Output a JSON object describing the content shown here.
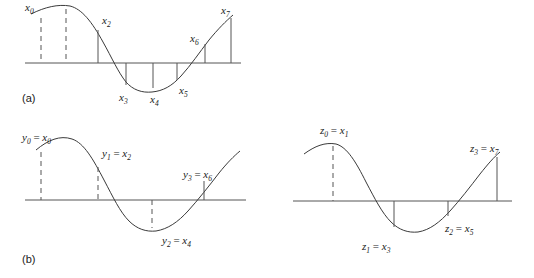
{
  "figure": {
    "title": "",
    "panels": [
      {
        "id": "a",
        "caption": "(a)",
        "signal": "continuous sinusoid-like waveform",
        "samples": [
          {
            "label": "x",
            "sub": "0",
            "text": "x0",
            "x": 41,
            "y": 18,
            "stem": "dashed",
            "side": "above"
          },
          {
            "label": "x",
            "sub": "1",
            "text": "x1",
            "x": 66,
            "y": 9,
            "stem": "dashed",
            "side": "above",
            "hidden": true
          },
          {
            "label": "x",
            "sub": "2",
            "text": "x2",
            "x": 98,
            "y": 26,
            "stem": "solid",
            "side": "above"
          },
          {
            "label": "x",
            "sub": "3",
            "text": "x3",
            "x": 126,
            "y": 88,
            "stem": "solid",
            "side": "below"
          },
          {
            "label": "x",
            "sub": "4",
            "text": "x4",
            "x": 153,
            "y": 91,
            "stem": "solid",
            "side": "below"
          },
          {
            "label": "x",
            "sub": "5",
            "text": "x5",
            "x": 177,
            "y": 80,
            "stem": "solid",
            "side": "below"
          },
          {
            "label": "x",
            "sub": "6",
            "text": "x6",
            "x": 205,
            "y": 45,
            "stem": "solid",
            "side": "above"
          },
          {
            "label": "x",
            "sub": "7",
            "text": "x7",
            "x": 231,
            "y": 18,
            "stem": "solid",
            "side": "above"
          }
        ]
      },
      {
        "id": "b-left",
        "caption": "(b)",
        "signal": "continuous sinusoid-like waveform, even-indexed samples",
        "samples": [
          {
            "text": "y0 = x0",
            "var": "y",
            "sub": "0",
            "eq": "=",
            "src": "x",
            "srcsub": "0",
            "x": 41,
            "stem": "dashed",
            "side": "above"
          },
          {
            "text": "y1 = x2",
            "var": "y",
            "sub": "1",
            "eq": "=",
            "src": "x",
            "srcsub": "2",
            "x": 98,
            "stem": "dashed",
            "side": "above"
          },
          {
            "text": "y2 = x4",
            "var": "y",
            "sub": "2",
            "eq": "=",
            "src": "x",
            "srcsub": "4",
            "x": 152,
            "stem": "dashed",
            "side": "below"
          },
          {
            "text": "y3 = x6",
            "var": "y",
            "sub": "3",
            "eq": "=",
            "src": "x",
            "srcsub": "6",
            "x": 204,
            "stem": "solid",
            "side": "above"
          }
        ]
      },
      {
        "id": "b-right",
        "caption": "",
        "signal": "continuous sinusoid-like waveform, odd-indexed samples",
        "samples": [
          {
            "text": "z0 = x1",
            "var": "z",
            "sub": "0",
            "eq": "=",
            "src": "x",
            "srcsub": "1",
            "x": 333,
            "stem": "dashed",
            "side": "above"
          },
          {
            "text": "z1 = x3",
            "var": "z",
            "sub": "1",
            "eq": "=",
            "src": "x",
            "srcsub": "3",
            "x": 394,
            "stem": "solid",
            "side": "below"
          },
          {
            "text": "z2 = x5",
            "var": "z",
            "sub": "2",
            "eq": "=",
            "src": "x",
            "srcsub": "5",
            "x": 448,
            "stem": "solid",
            "side": "below"
          },
          {
            "text": "z3 = x7",
            "var": "z",
            "sub": "3",
            "eq": "=",
            "src": "x",
            "srcsub": "7",
            "x": 497,
            "stem": "solid",
            "side": "above"
          }
        ]
      }
    ],
    "labels": {
      "panel_a": "(a)",
      "panel_b": "(b)",
      "x0": "x",
      "x0s": "0",
      "x2": "x",
      "x2s": "2",
      "x3": "x",
      "x3s": "3",
      "x4": "x",
      "x4s": "4",
      "x5": "x",
      "x5s": "5",
      "x6": "x",
      "x6s": "6",
      "x7": "x",
      "x7s": "7",
      "y0v": "y",
      "y0s": "0",
      "y0eq": " = ",
      "y0r": "x",
      "y0rs": "0",
      "y1v": "y",
      "y1s": "1",
      "y1eq": " = ",
      "y1r": "x",
      "y1rs": "2",
      "y2v": "y",
      "y2s": "2",
      "y2eq": " = ",
      "y2r": "x",
      "y2rs": "4",
      "y3v": "y",
      "y3s": "3",
      "y3eq": " = ",
      "y3r": "x",
      "y3rs": "6",
      "z0v": "z",
      "z0s": "0",
      "z0eq": " = ",
      "z0r": "x",
      "z0rs": "1",
      "z1v": "z",
      "z1s": "1",
      "z1eq": " = ",
      "z1r": "x",
      "z1rs": "3",
      "z2v": "z",
      "z2s": "2",
      "z2eq": " = ",
      "z2r": "x",
      "z2rs": "5",
      "z3v": "z",
      "z3s": "3",
      "z3eq": " = ",
      "z3r": "x",
      "z3rs": "7"
    },
    "colors": {
      "curve": "#3a3a3a",
      "axis": "#555555",
      "text": "#1a1a1a",
      "background": "#ffffff"
    }
  }
}
